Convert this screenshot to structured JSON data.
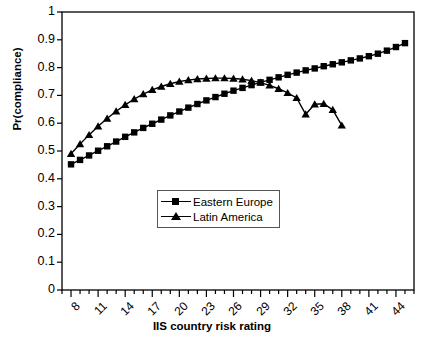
{
  "chart_data": {
    "type": "line",
    "title": "",
    "xlabel": "IIS country risk rating",
    "ylabel": "Pr(compliance)",
    "xlim": [
      7,
      46
    ],
    "ylim": [
      0,
      1
    ],
    "xtick_labels": [
      "8",
      "11",
      "14",
      "17",
      "20",
      "23",
      "26",
      "29",
      "32",
      "35",
      "38",
      "41",
      "44"
    ],
    "xtick_values": [
      8,
      11,
      14,
      17,
      20,
      23,
      26,
      29,
      32,
      35,
      38,
      41,
      44
    ],
    "xtick_step_minor": 1,
    "ytick_labels": [
      "0",
      "0.1",
      "0.2",
      "0.3",
      "0.4",
      "0.5",
      "0.6",
      "0.7",
      "0.8",
      "0.9",
      "1"
    ],
    "ytick_values": [
      0,
      0.1,
      0.2,
      0.3,
      0.4,
      0.5,
      0.6,
      0.7,
      0.8,
      0.9,
      1
    ],
    "grid": false,
    "legend_position": "center-left-lower",
    "series": [
      {
        "name": "Eastern Europe",
        "marker": "square",
        "color": "#000000",
        "x": [
          8,
          9,
          10,
          11,
          12,
          13,
          14,
          15,
          16,
          17,
          18,
          19,
          20,
          21,
          22,
          23,
          24,
          25,
          26,
          27,
          28,
          29,
          30,
          31,
          32,
          33,
          34,
          35,
          36,
          37,
          38,
          39,
          40,
          41,
          42,
          43,
          44,
          45
        ],
        "y": [
          0.452,
          0.468,
          0.484,
          0.501,
          0.517,
          0.534,
          0.551,
          0.567,
          0.583,
          0.598,
          0.613,
          0.628,
          0.642,
          0.656,
          0.669,
          0.682,
          0.694,
          0.706,
          0.717,
          0.727,
          0.737,
          0.747,
          0.756,
          0.765,
          0.774,
          0.782,
          0.79,
          0.797,
          0.805,
          0.812,
          0.819,
          0.826,
          0.833,
          0.841,
          0.85,
          0.861,
          0.874,
          0.888
        ]
      },
      {
        "name": "Latin America",
        "marker": "triangle",
        "color": "#000000",
        "x": [
          8,
          9,
          10,
          11,
          12,
          13,
          14,
          15,
          16,
          17,
          18,
          19,
          20,
          21,
          22,
          23,
          24,
          25,
          26,
          27,
          28,
          29,
          30,
          31,
          32,
          33,
          34,
          35,
          36,
          37,
          38
        ],
        "y": [
          0.49,
          0.525,
          0.558,
          0.589,
          0.617,
          0.643,
          0.666,
          0.687,
          0.705,
          0.72,
          0.732,
          0.742,
          0.75,
          0.755,
          0.759,
          0.761,
          0.762,
          0.762,
          0.761,
          0.758,
          0.753,
          0.746,
          0.736,
          0.724,
          0.709,
          0.691,
          0.632,
          0.668,
          0.67,
          0.648,
          0.592
        ]
      }
    ],
    "series_note": {
      "latin_america_tail_monotonic": [
        0.709,
        0.691,
        0.67,
        0.648,
        0.622,
        0.592
      ]
    }
  }
}
